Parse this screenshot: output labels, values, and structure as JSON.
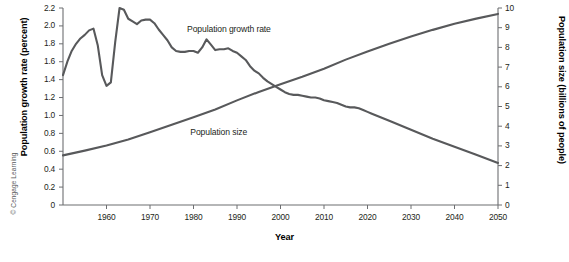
{
  "figure": {
    "credit": "© Cengage Learning",
    "line_color": "#58595b",
    "axis_color": "#6d6e71",
    "text_color": "#231f20"
  },
  "chart_data": {
    "type": "line",
    "title": "",
    "xlabel": "Year",
    "grid": false,
    "legend_position": "inline-annotations",
    "xlim": [
      1950,
      2050
    ],
    "xticks": [
      1960,
      1970,
      1980,
      1990,
      2000,
      2010,
      2020,
      2030,
      2040,
      2050
    ],
    "xtick_labels": [
      "1960",
      "1970",
      "1980",
      "1990",
      "2000",
      "2010",
      "2020",
      "2030",
      "2040",
      "2050"
    ],
    "axes": [
      {
        "id": "left",
        "ylabel": "Population growth rate (percent)",
        "ylim": [
          0,
          2.2
        ],
        "yticks": [
          0,
          0.2,
          0.4,
          0.6,
          0.8,
          1.0,
          1.2,
          1.4,
          1.6,
          1.8,
          2.0,
          2.2
        ],
        "ytick_labels": [
          "0",
          "0.2",
          "0.4",
          "0.6",
          "0.8",
          "1.0",
          "1.2",
          "1.4",
          "1.6",
          "1.8",
          "2.0",
          "2.2"
        ]
      },
      {
        "id": "right",
        "ylabel": "Population size (billions of people)",
        "ylim": [
          0,
          10
        ],
        "yticks": [
          0,
          1,
          2,
          3,
          4,
          5,
          6,
          7,
          8,
          9,
          10
        ],
        "ytick_labels": [
          "0",
          "1",
          "2",
          "3",
          "4",
          "5",
          "6",
          "7",
          "8",
          "9",
          "10"
        ]
      }
    ],
    "series": [
      {
        "name": "Population growth rate",
        "axis": "left",
        "units": "percent",
        "annotation": "Population growth rate",
        "x": [
          1950,
          1951,
          1952,
          1953,
          1954,
          1955,
          1956,
          1957,
          1958,
          1959,
          1960,
          1961,
          1962,
          1963,
          1964,
          1965,
          1966,
          1967,
          1968,
          1969,
          1970,
          1971,
          1972,
          1973,
          1974,
          1975,
          1976,
          1977,
          1978,
          1979,
          1980,
          1981,
          1982,
          1983,
          1984,
          1985,
          1986,
          1987,
          1988,
          1989,
          1990,
          1991,
          1992,
          1993,
          1994,
          1995,
          1996,
          1997,
          1998,
          1999,
          2000,
          2001,
          2002,
          2003,
          2004,
          2005,
          2006,
          2007,
          2008,
          2009,
          2010,
          2011,
          2012,
          2013,
          2014,
          2015,
          2016,
          2017,
          2018,
          2019,
          2020,
          2021,
          2022,
          2023,
          2024,
          2025,
          2030,
          2035,
          2040,
          2045,
          2050
        ],
        "values": [
          1.45,
          1.6,
          1.72,
          1.8,
          1.86,
          1.9,
          1.95,
          1.97,
          1.78,
          1.45,
          1.33,
          1.37,
          1.82,
          2.2,
          2.18,
          2.08,
          2.05,
          2.02,
          2.06,
          2.07,
          2.07,
          2.03,
          1.96,
          1.9,
          1.84,
          1.76,
          1.72,
          1.71,
          1.71,
          1.72,
          1.72,
          1.7,
          1.76,
          1.85,
          1.79,
          1.73,
          1.74,
          1.74,
          1.75,
          1.72,
          1.7,
          1.66,
          1.62,
          1.55,
          1.5,
          1.47,
          1.42,
          1.38,
          1.35,
          1.32,
          1.29,
          1.26,
          1.24,
          1.23,
          1.23,
          1.22,
          1.21,
          1.2,
          1.2,
          1.19,
          1.17,
          1.16,
          1.15,
          1.14,
          1.12,
          1.1,
          1.09,
          1.09,
          1.08,
          1.06,
          1.04,
          1.02,
          1.0,
          0.98,
          0.96,
          0.94,
          0.84,
          0.74,
          0.65,
          0.56,
          0.47
        ]
      },
      {
        "name": "Population size",
        "axis": "right",
        "units": "billions of people",
        "annotation": "Population size",
        "x": [
          1950,
          1955,
          1960,
          1965,
          1970,
          1975,
          1980,
          1985,
          1990,
          1995,
          2000,
          2005,
          2010,
          2015,
          2020,
          2025,
          2030,
          2035,
          2040,
          2045,
          2050
        ],
        "values": [
          2.52,
          2.76,
          3.02,
          3.33,
          3.69,
          4.07,
          4.45,
          4.85,
          5.31,
          5.74,
          6.13,
          6.51,
          6.92,
          7.38,
          7.79,
          8.18,
          8.55,
          8.89,
          9.2,
          9.46,
          9.7
        ]
      }
    ],
    "annotations": [
      {
        "text": "Population growth rate",
        "x": 1990,
        "y_axis": "left",
        "y": 1.95
      },
      {
        "text": "Population size",
        "x": 1988,
        "y_axis": "left",
        "y": 0.8
      }
    ]
  }
}
